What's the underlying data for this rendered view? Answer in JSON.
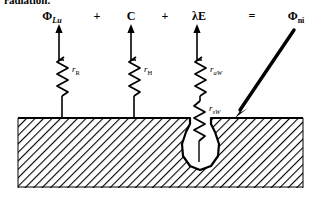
{
  "figure": {
    "name": "leaf-energy-balance-resistance-diagram",
    "caption_fragment": "radiation.",
    "background_color": "#ffffff",
    "ink_color": "#000000"
  },
  "equation": {
    "terms": [
      {
        "id": "term-phi-lu",
        "symbol": "Φ",
        "subscript": "Lu",
        "subscript_style": "italic"
      },
      {
        "id": "op-plus-1",
        "symbol": "+"
      },
      {
        "id": "term-c",
        "symbol": "C",
        "subscript": "",
        "subscript_style": "none"
      },
      {
        "id": "op-plus-2",
        "symbol": "+"
      },
      {
        "id": "term-lambda-e",
        "symbol": "λE",
        "subscript": "",
        "subscript_style": "none"
      },
      {
        "id": "op-equals",
        "symbol": "="
      },
      {
        "id": "term-phi-ni",
        "symbol": "Φ",
        "subscript": "ni",
        "subscript_style": "upright"
      }
    ],
    "plain_text": "ΦLu + C + λE = Φni"
  },
  "resistors": [
    {
      "id": "resistor-r-R",
      "symbol": "r",
      "subscript": "R",
      "subscript_style": "upright",
      "label": "rR"
    },
    {
      "id": "resistor-r-H",
      "symbol": "r",
      "subscript": "H",
      "subscript_style": "upright",
      "label": "rH"
    },
    {
      "id": "resistor-r-aW",
      "symbol": "r",
      "subscript": "aW",
      "subscript_style": "mixed",
      "label": "raW"
    },
    {
      "id": "resistor-r-sW",
      "symbol": "r",
      "subscript": "sW",
      "subscript_style": "mixed",
      "label": "rsW"
    }
  ],
  "arrows": [
    {
      "id": "flux-arrow-phi-lu",
      "direction": "up",
      "style": "thin"
    },
    {
      "id": "flux-arrow-c",
      "direction": "up",
      "style": "thin"
    },
    {
      "id": "flux-arrow-lambda-e",
      "direction": "up",
      "style": "thin"
    },
    {
      "id": "flux-arrow-phi-ni",
      "direction": "down-left",
      "style": "thick"
    }
  ],
  "surface": {
    "id": "leaf-surface",
    "fill_pattern": "diagonal-hatch",
    "description": "hatched substrate block"
  },
  "cavity": {
    "id": "substomatal-cavity",
    "shape": "flask",
    "fill": "#ffffff",
    "description": "bulb-shaped cavity with narrow neck opening at the surface"
  }
}
